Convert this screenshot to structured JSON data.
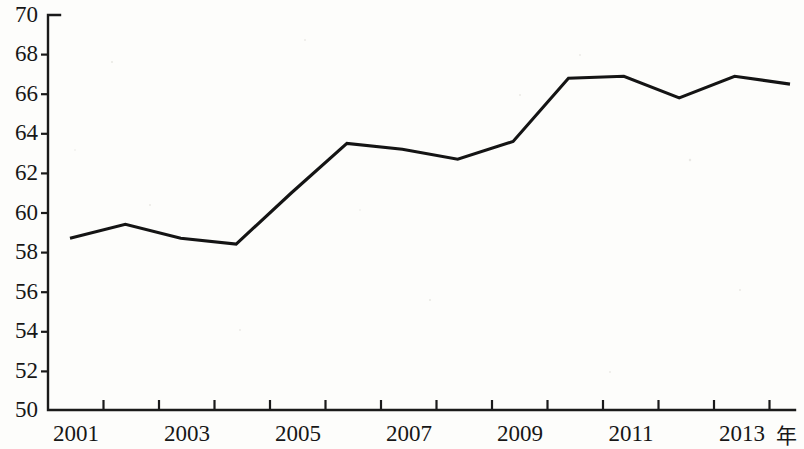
{
  "chart_data": {
    "type": "line",
    "title": "",
    "xlabel": "年",
    "ylabel": "",
    "x": [
      2001,
      2002,
      2003,
      2004,
      2005,
      2006,
      2007,
      2008,
      2009,
      2010,
      2011,
      2012,
      2013,
      2014
    ],
    "values": [
      58.7,
      59.4,
      58.7,
      58.4,
      61.0,
      63.5,
      63.2,
      62.7,
      63.6,
      66.8,
      66.9,
      65.8,
      66.9,
      66.5
    ],
    "series": [
      {
        "name": "",
        "values": [
          58.7,
          59.4,
          58.7,
          58.4,
          61.0,
          63.5,
          63.2,
          62.7,
          63.6,
          66.8,
          66.9,
          65.8,
          66.9,
          66.5
        ]
      }
    ],
    "ylim": [
      50,
      70
    ],
    "xlim": [
      2001,
      2014
    ],
    "yticks": [
      50,
      52,
      54,
      56,
      58,
      60,
      62,
      64,
      66,
      68,
      70
    ],
    "ytick_labels": [
      "50",
      "52",
      "54",
      "56",
      "58",
      "60",
      "62",
      "64",
      "66",
      "68",
      "70"
    ],
    "xticks": [
      2001,
      2002,
      2003,
      2004,
      2005,
      2006,
      2007,
      2008,
      2009,
      2010,
      2011,
      2012,
      2013,
      2014
    ],
    "xtick_labels_shown": [
      "2001",
      "2003",
      "2005",
      "2007",
      "2009",
      "2011",
      "2013"
    ],
    "xtick_labeled_values": [
      2001,
      2003,
      2005,
      2007,
      2009,
      2011,
      2013
    ],
    "grid": false,
    "legend": false,
    "legend_position": "none",
    "line_color": "#141414",
    "axis_color": "#1a1a1a",
    "background_color": "#fdfdfb"
  }
}
